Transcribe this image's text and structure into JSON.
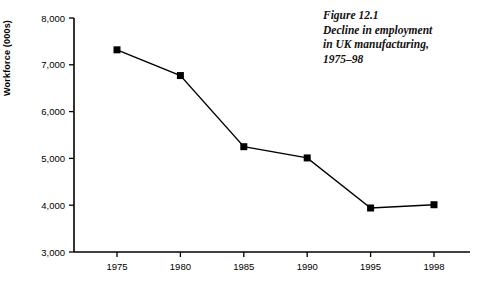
{
  "figure": {
    "caption_lines": [
      "Figure 12.1",
      "Decline in employment",
      "in UK manufacturing,",
      "1975–98"
    ]
  },
  "chart_data": {
    "type": "line",
    "title": "",
    "xlabel": "",
    "ylabel": "Workforce (000s)",
    "categories": [
      "1975",
      "1980",
      "1985",
      "1990",
      "1995",
      "1998"
    ],
    "values": [
      7320,
      6770,
      5250,
      5010,
      3940,
      4010
    ],
    "x_tick_labels": [
      "1975",
      "1980",
      "1985",
      "1990",
      "1995",
      "1998"
    ],
    "y_tick_labels": [
      "3,000",
      "4,000",
      "5,000",
      "6,000",
      "7,000",
      "8,000"
    ],
    "y_ticks": [
      3000,
      4000,
      5000,
      6000,
      7000,
      8000
    ],
    "ylim": [
      3000,
      8000
    ],
    "grid": false,
    "legend": "none",
    "marker": "square",
    "line_color": "#000000",
    "marker_color": "#000000",
    "background_color": "#ffffff"
  }
}
